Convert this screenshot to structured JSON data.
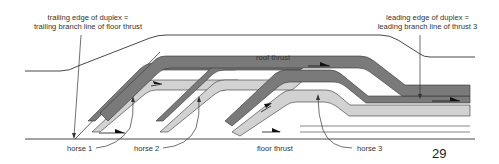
{
  "labels": {
    "trailing_edge_line1": "trailing edge of duplex =",
    "trailing_edge_line2": "trailing branch line of floor thrust",
    "leading_edge_line1": "leading edge of duplex =",
    "leading_edge_line2": "leading branch line of thrust 3",
    "roof_thrust": "roof thrust",
    "floor_thrust": "floor thrust",
    "horse_1": "horse 1",
    "horse_2": "horse 2",
    "horse_3": "horse 3"
  },
  "page_number": "29",
  "colors": {
    "dark_layer": "#7a7a7a",
    "light_layer": "#d2d2d2",
    "line": "#333333"
  }
}
